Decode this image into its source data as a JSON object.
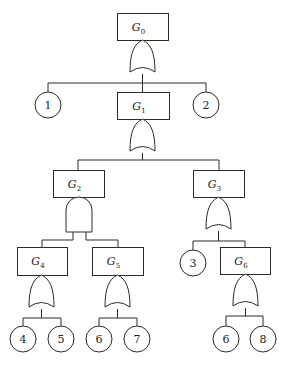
{
  "diagram": {
    "type": "fault-tree",
    "colors": {
      "stroke": "#2a2a2a",
      "background": "#ffffff",
      "text": "#222222"
    },
    "gates": [
      {
        "id": "G0",
        "letter": "G",
        "sub": "0",
        "box": [
          117,
          13,
          51,
          27
        ],
        "gate_type": "OR",
        "gate": [
          130,
          40,
          25,
          34
        ]
      },
      {
        "id": "G1",
        "letter": "G",
        "sub": "1",
        "box": [
          117,
          92,
          52,
          27
        ],
        "gate_type": "OR",
        "gate": [
          130,
          119,
          25,
          34
        ]
      },
      {
        "id": "G2",
        "letter": "G",
        "sub": "2",
        "box": [
          53,
          170,
          51,
          27
        ],
        "gate_type": "AND",
        "gate": [
          66,
          197,
          26,
          35
        ]
      },
      {
        "id": "G3",
        "letter": "G",
        "sub": "3",
        "box": [
          193,
          170,
          51,
          27
        ],
        "gate_type": "OR",
        "gate": [
          206,
          197,
          25,
          34
        ]
      },
      {
        "id": "G4",
        "letter": "G",
        "sub": "4",
        "box": [
          17,
          247,
          50,
          28
        ],
        "gate_type": "OR",
        "gate": [
          29,
          275,
          25,
          34
        ]
      },
      {
        "id": "G5",
        "letter": "G",
        "sub": "5",
        "box": [
          92,
          247,
          51,
          28
        ],
        "gate_type": "OR",
        "gate": [
          105,
          275,
          25,
          34
        ]
      },
      {
        "id": "G6",
        "letter": "G",
        "sub": "6",
        "box": [
          220,
          247,
          50,
          27
        ],
        "gate_type": "OR",
        "gate": [
          233,
          274,
          25,
          34
        ]
      }
    ],
    "events": [
      {
        "label": "1",
        "cx": 48,
        "cy": 105,
        "r": 13
      },
      {
        "label": "2",
        "cx": 206,
        "cy": 105,
        "r": 13
      },
      {
        "label": "3",
        "cx": 193,
        "cy": 263,
        "r": 13
      },
      {
        "label": "4",
        "cx": 23,
        "cy": 339,
        "r": 13
      },
      {
        "label": "5",
        "cx": 61,
        "cy": 339,
        "r": 13
      },
      {
        "label": "6",
        "cx": 99,
        "cy": 339,
        "r": 13
      },
      {
        "label": "7",
        "cx": 137,
        "cy": 339,
        "r": 13
      },
      {
        "label": "6",
        "cx": 226,
        "cy": 339,
        "r": 13
      },
      {
        "label": "8",
        "cx": 263,
        "cy": 339,
        "r": 13
      }
    ],
    "edges": [
      {
        "from": "G0",
        "to": [
          "1",
          "G1",
          "2"
        ]
      },
      {
        "from": "G1",
        "to": [
          "G2",
          "G3"
        ]
      },
      {
        "from": "G2",
        "to": [
          "G4",
          "G5"
        ]
      },
      {
        "from": "G3",
        "to": [
          "3",
          "G6"
        ]
      },
      {
        "from": "G4",
        "to": [
          "4",
          "5"
        ]
      },
      {
        "from": "G5",
        "to": [
          "6",
          "7"
        ]
      },
      {
        "from": "G6",
        "to": [
          "6",
          "8"
        ]
      }
    ],
    "connectors": [
      "M142.5 74 V83",
      "M48 83 H206",
      "M48 83 V92",
      "M206 83 V92",
      "M142.5 83 V92",
      "M142.5 153 V160",
      "M78 160 H219",
      "M78 160 V170",
      "M219 160 V170",
      "M73 232 V240",
      "M86 232 V240",
      "M42 240 H73",
      "M86 240 H118",
      "M42 240 V247",
      "M118 240 V247",
      "M218.5 231 V241",
      "M193 241 H245",
      "M193 241 V250",
      "M245 241 V247",
      "M41.5 309 V318",
      "M23 318 H61",
      "M23 318 V326",
      "M61 318 V326",
      "M117.5 309 V318",
      "M99 318 H137",
      "M99 318 V326",
      "M137 318 V326",
      "M245.5 308 V316",
      "M226 316 H263",
      "M226 316 V326",
      "M263 316 V326"
    ]
  }
}
